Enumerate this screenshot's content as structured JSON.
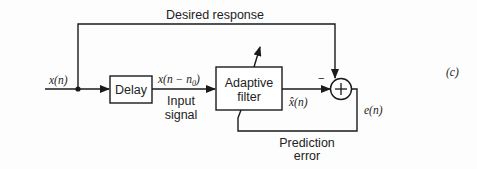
{
  "diagram": {
    "label": "(c)",
    "blocks": {
      "delay": "Delay",
      "adaptive_filter_line1": "Adaptive",
      "adaptive_filter_line2": "filter",
      "summer_symbol": "+"
    },
    "signals": {
      "input": "x(n)",
      "delayed": "x(n − n",
      "delayed_sub": "0",
      "delayed_close": ")",
      "estimate": "x̂(n)",
      "error": "e(n)"
    },
    "annotations": {
      "desired_response": "Desired response",
      "input_signal_line1": "Input",
      "input_signal_line2": "signal",
      "prediction_error_line1": "Prediction",
      "prediction_error_line2": "error",
      "minus_sign": "−"
    },
    "colors": {
      "line": "#1a1a1a",
      "background": "#fdfdfd"
    }
  }
}
